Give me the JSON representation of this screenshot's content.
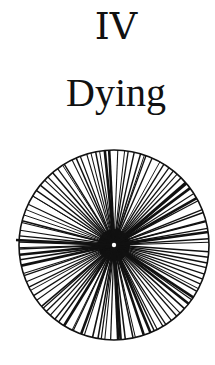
{
  "page": {
    "chapter_number": "IV",
    "chapter_title": "Dying"
  },
  "figure": {
    "type": "radial-spoke-diagram",
    "center": [
      114,
      105
    ],
    "radius": 95,
    "stroke_color": "#111111",
    "center_dot_color": "#ffffff",
    "spoke_count": 110
  }
}
